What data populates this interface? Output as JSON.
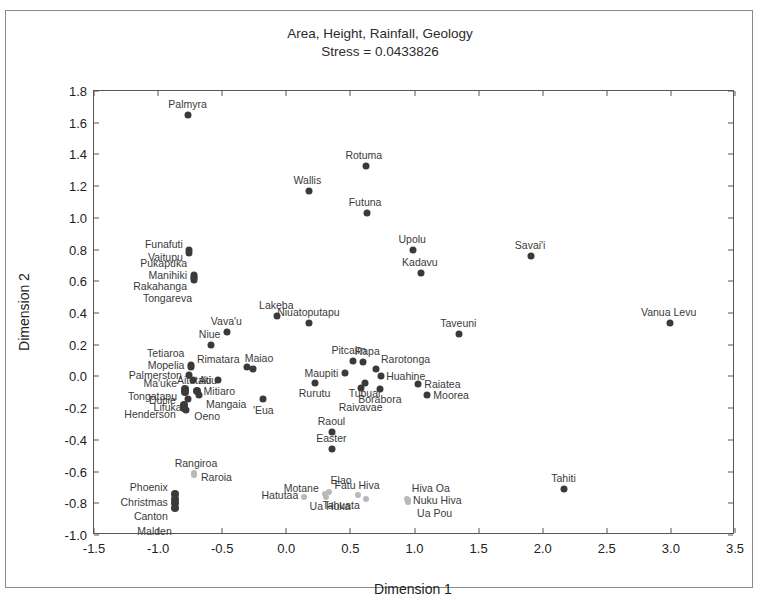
{
  "chart_data": {
    "type": "scatter",
    "title": "Area, Height, Rainfall, Geology",
    "subtitle": "Stress = 0.0433826",
    "xlabel": "Dimension 1",
    "ylabel": "Dimension 2",
    "xlim": [
      -1.5,
      3.5
    ],
    "ylim": [
      -1.0,
      1.8
    ],
    "xticks": [
      "-1.5",
      "-1.0",
      "-0.5",
      "0.0",
      "0.5",
      "1.0",
      "1.5",
      "2.0",
      "2.5",
      "3.0",
      "3.5"
    ],
    "xtick_values": [
      -1.5,
      -1.0,
      -0.5,
      0.0,
      0.5,
      1.0,
      1.5,
      2.0,
      2.5,
      3.0,
      3.5
    ],
    "yticks": [
      "1.8",
      "1.6",
      "1.4",
      "1.2",
      "1.0",
      "0.8",
      "0.6",
      "0.4",
      "0.2",
      "0.0",
      "-0.2",
      "-0.4",
      "-0.6",
      "-0.8",
      "-1.0"
    ],
    "ytick_values": [
      1.8,
      1.6,
      1.4,
      1.2,
      1.0,
      0.8,
      0.6,
      0.4,
      0.2,
      0.0,
      -0.2,
      -0.4,
      -0.6,
      -0.8,
      -1.0
    ],
    "grid": false,
    "legend": "none",
    "marker_colors": {
      "dark": "#3a3a3a",
      "mid": "#707070",
      "light": "#b9b9b9"
    },
    "points": [
      {
        "label": "Palmyra",
        "x": -0.77,
        "y": 1.65,
        "shade": "dark",
        "size": 7,
        "lpos": "c",
        "ldx": 0,
        "ldy": -11
      },
      {
        "label": "Rotuma",
        "x": 0.62,
        "y": 1.33,
        "shade": "dark",
        "size": 7,
        "lpos": "c",
        "ldx": -2,
        "ldy": -11
      },
      {
        "label": "Wallis",
        "x": 0.18,
        "y": 1.17,
        "shade": "dark",
        "size": 7,
        "lpos": "c",
        "ldx": -2,
        "ldy": -11
      },
      {
        "label": "Futuna",
        "x": 0.63,
        "y": 1.03,
        "shade": "dark",
        "size": 7,
        "lpos": "c",
        "ldx": -2,
        "ldy": -11
      },
      {
        "label": "Funafuti",
        "x": -0.76,
        "y": 0.8,
        "shade": "dark",
        "size": 7,
        "lpos": "r",
        "ldx": -6,
        "ldy": -6
      },
      {
        "label": "Vaitupu",
        "x": -0.76,
        "y": 0.78,
        "shade": "dark",
        "size": 7,
        "lpos": "r",
        "ldx": -6,
        "ldy": 4
      },
      {
        "label": "Upolu",
        "x": 0.99,
        "y": 0.8,
        "shade": "dark",
        "size": 7,
        "lpos": "c",
        "ldx": -1,
        "ldy": -11
      },
      {
        "label": "Savai'i",
        "x": 1.91,
        "y": 0.76,
        "shade": "dark",
        "size": 7,
        "lpos": "c",
        "ldx": -1,
        "ldy": -11
      },
      {
        "label": "Kadavu",
        "x": 1.05,
        "y": 0.65,
        "shade": "dark",
        "size": 7,
        "lpos": "c",
        "ldx": -1,
        "ldy": -11
      },
      {
        "label": "Pukapuka",
        "x": -0.72,
        "y": 0.64,
        "shade": "dark",
        "size": 7,
        "lpos": "r",
        "ldx": -7,
        "ldy": -12
      },
      {
        "label": "Manihiki",
        "x": -0.72,
        "y": 0.63,
        "shade": "dark",
        "size": 7,
        "lpos": "r",
        "ldx": -7,
        "ldy": -2
      },
      {
        "label": "Rakahanga",
        "x": -0.72,
        "y": 0.62,
        "shade": "dark",
        "size": 7,
        "lpos": "r",
        "ldx": -7,
        "ldy": 8
      },
      {
        "label": "Tongareva",
        "x": -0.72,
        "y": 0.61,
        "shade": "dark",
        "size": 7,
        "lpos": "r",
        "ldx": -2,
        "ldy": 18
      },
      {
        "label": "Lakeba",
        "x": -0.07,
        "y": 0.38,
        "shade": "dark",
        "size": 7,
        "lpos": "c",
        "ldx": -1,
        "ldy": -11
      },
      {
        "label": "Niuatoputapu",
        "x": 0.18,
        "y": 0.34,
        "shade": "dark",
        "size": 7,
        "lpos": "c",
        "ldx": -1,
        "ldy": -11
      },
      {
        "label": "Taveuni",
        "x": 1.35,
        "y": 0.27,
        "shade": "dark",
        "size": 7,
        "lpos": "c",
        "ldx": -1,
        "ldy": -11
      },
      {
        "label": "Vanua Levu",
        "x": 2.99,
        "y": 0.34,
        "shade": "dark",
        "size": 7,
        "lpos": "c",
        "ldx": -1,
        "ldy": -11
      },
      {
        "label": "Vava'u",
        "x": -0.46,
        "y": 0.28,
        "shade": "dark",
        "size": 7,
        "lpos": "c",
        "ldx": -1,
        "ldy": -11
      },
      {
        "label": "Niue",
        "x": -0.59,
        "y": 0.2,
        "shade": "dark",
        "size": 7,
        "lpos": "c",
        "ldx": -1,
        "ldy": -11
      },
      {
        "label": "Tetiaroa",
        "x": -0.74,
        "y": 0.07,
        "shade": "dark",
        "size": 7,
        "lpos": "r",
        "ldx": -7,
        "ldy": -12
      },
      {
        "label": "Mopelia",
        "x": -0.74,
        "y": 0.06,
        "shade": "dark",
        "size": 7,
        "lpos": "r",
        "ldx": -7,
        "ldy": -2
      },
      {
        "label": "Rimatara",
        "x": -0.31,
        "y": 0.06,
        "shade": "dark",
        "size": 7,
        "lpos": "r",
        "ldx": -7,
        "ldy": -8
      },
      {
        "label": "Maiao",
        "x": -0.26,
        "y": 0.05,
        "shade": "dark",
        "size": 7,
        "lpos": "c",
        "ldx": 6,
        "ldy": -11
      },
      {
        "label": "Pitcairn",
        "x": 0.52,
        "y": 0.1,
        "shade": "dark",
        "size": 7,
        "lpos": "c",
        "ldx": -4,
        "ldy": -11
      },
      {
        "label": "Rapa",
        "x": 0.6,
        "y": 0.09,
        "shade": "dark",
        "size": 7,
        "lpos": "c",
        "ldx": 4,
        "ldy": -11
      },
      {
        "label": "Palmerston",
        "x": -0.76,
        "y": 0.01,
        "shade": "dark",
        "size": 7,
        "lpos": "r",
        "ldx": -7,
        "ldy": 0
      },
      {
        "label": "Atiu",
        "x": -0.73,
        "y": -0.02,
        "shade": "dark",
        "size": 7,
        "lpos": "l",
        "ldx": 6,
        "ldy": 0
      },
      {
        "label": "Aitutaki",
        "x": -0.53,
        "y": -0.02,
        "shade": "dark",
        "size": 7,
        "lpos": "r",
        "ldx": -7,
        "ldy": 0
      },
      {
        "label": "Maupiti",
        "x": 0.46,
        "y": 0.02,
        "shade": "dark",
        "size": 7,
        "lpos": "r",
        "ldx": -7,
        "ldy": 0
      },
      {
        "label": "Rarotonga",
        "x": 0.7,
        "y": 0.05,
        "shade": "dark",
        "size": 7,
        "lpos": "l",
        "ldx": 5,
        "ldy": -10
      },
      {
        "label": "Huahine",
        "x": 0.74,
        "y": 0.0,
        "shade": "dark",
        "size": 7,
        "lpos": "l",
        "ldx": 5,
        "ldy": 0
      },
      {
        "label": "Raiatea",
        "x": 1.03,
        "y": -0.05,
        "shade": "dark",
        "size": 7,
        "lpos": "l",
        "ldx": 6,
        "ldy": 0
      },
      {
        "label": "Ma'uke",
        "x": -0.79,
        "y": -0.08,
        "shade": "dark",
        "size": 8,
        "lpos": "r",
        "ldx": -8,
        "ldy": -6
      },
      {
        "label": "Tongatapu",
        "x": -0.79,
        "y": -0.1,
        "shade": "dark",
        "size": 8,
        "lpos": "r",
        "ldx": -8,
        "ldy": 4
      },
      {
        "label": "Mitiaro",
        "x": -0.7,
        "y": -0.09,
        "shade": "dark",
        "size": 8,
        "lpos": "l",
        "ldx": 7,
        "ldy": 0
      },
      {
        "label": "Mangaia",
        "x": -0.68,
        "y": -0.12,
        "shade": "dark",
        "size": 7,
        "lpos": "l",
        "ldx": 7,
        "ldy": 9
      },
      {
        "label": "Lifuka",
        "x": -0.77,
        "y": -0.14,
        "shade": "dark",
        "size": 7,
        "lpos": "r",
        "ldx": -6,
        "ldy": 8
      },
      {
        "label": "Rurutu",
        "x": 0.22,
        "y": -0.04,
        "shade": "dark",
        "size": 7,
        "lpos": "c",
        "ldx": 0,
        "ldy": 10
      },
      {
        "label": "Tubuai",
        "x": 0.61,
        "y": -0.04,
        "shade": "dark",
        "size": 7,
        "lpos": "c",
        "ldx": 0,
        "ldy": 10
      },
      {
        "label": "Raivavae",
        "x": 0.58,
        "y": -0.07,
        "shade": "dark",
        "size": 7,
        "lpos": "c",
        "ldx": 0,
        "ldy": 19
      },
      {
        "label": "Borabora",
        "x": 0.73,
        "y": -0.08,
        "shade": "dark",
        "size": 7,
        "lpos": "c",
        "ldx": 0,
        "ldy": 10
      },
      {
        "label": "Moorea",
        "x": 1.1,
        "y": -0.12,
        "shade": "dark",
        "size": 7,
        "lpos": "l",
        "ldx": 6,
        "ldy": 0
      },
      {
        "label": "'Eua",
        "x": -0.18,
        "y": -0.14,
        "shade": "dark",
        "size": 7,
        "lpos": "c",
        "ldx": 0,
        "ldy": 11
      },
      {
        "label": "Ducie",
        "x": -0.8,
        "y": -0.18,
        "shade": "dark",
        "size": 8,
        "lpos": "r",
        "ldx": -8,
        "ldy": -5
      },
      {
        "label": "Henderson",
        "x": -0.8,
        "y": -0.2,
        "shade": "dark",
        "size": 8,
        "lpos": "r",
        "ldx": -8,
        "ldy": 6
      },
      {
        "label": "Oeno",
        "x": -0.78,
        "y": -0.21,
        "shade": "dark",
        "size": 7,
        "lpos": "l",
        "ldx": 8,
        "ldy": 6
      },
      {
        "label": "Raoul",
        "x": 0.36,
        "y": -0.35,
        "shade": "dark",
        "size": 7,
        "lpos": "c",
        "ldx": -1,
        "ldy": -11
      },
      {
        "label": "Easter",
        "x": 0.36,
        "y": -0.46,
        "shade": "dark",
        "size": 7,
        "lpos": "c",
        "ldx": -1,
        "ldy": -11
      },
      {
        "label": "Rangiroa",
        "x": -0.72,
        "y": -0.61,
        "shade": "light",
        "size": 6,
        "lpos": "c",
        "ldx": 2,
        "ldy": -10
      },
      {
        "label": "Raroia",
        "x": -0.72,
        "y": -0.62,
        "shade": "light",
        "size": 6,
        "lpos": "l",
        "ldx": 7,
        "ldy": 2
      },
      {
        "label": "Tahiti",
        "x": 2.17,
        "y": -0.71,
        "shade": "dark",
        "size": 7,
        "lpos": "c",
        "ldx": -1,
        "ldy": -11
      },
      {
        "label": "Motane",
        "x": 0.3,
        "y": -0.74,
        "shade": "light",
        "size": 6,
        "lpos": "r",
        "ldx": -6,
        "ldy": -6
      },
      {
        "label": "Elao",
        "x": 0.33,
        "y": -0.73,
        "shade": "light",
        "size": 6,
        "lpos": "l",
        "ldx": 2,
        "ldy": -12
      },
      {
        "label": "Hatutaa",
        "x": 0.14,
        "y": -0.76,
        "shade": "light",
        "size": 6,
        "lpos": "r",
        "ldx": -6,
        "ldy": -2
      },
      {
        "label": "Ua Huka",
        "x": 0.31,
        "y": -0.76,
        "shade": "light",
        "size": 6,
        "lpos": "c",
        "ldx": 4,
        "ldy": 9
      },
      {
        "label": "Fatu Hiva",
        "x": 0.56,
        "y": -0.75,
        "shade": "light",
        "size": 6,
        "lpos": "c",
        "ldx": -1,
        "ldy": -10
      },
      {
        "label": "Tahuata",
        "x": 0.62,
        "y": -0.77,
        "shade": "light",
        "size": 6,
        "lpos": "r",
        "ldx": -6,
        "ldy": 6
      },
      {
        "label": "Hiva Oa",
        "x": 0.94,
        "y": -0.77,
        "shade": "light",
        "size": 6,
        "lpos": "l",
        "ldx": 5,
        "ldy": -11
      },
      {
        "label": "Nuku Hiva",
        "x": 0.95,
        "y": -0.78,
        "shade": "light",
        "size": 6,
        "lpos": "l",
        "ldx": 5,
        "ldy": 0
      },
      {
        "label": "Ua Pou",
        "x": 0.95,
        "y": -0.79,
        "shade": "light",
        "size": 6,
        "lpos": "l",
        "ldx": 9,
        "ldy": 11
      },
      {
        "label": "Phoenix",
        "x": -0.87,
        "y": -0.74,
        "shade": "dark",
        "size": 8,
        "lpos": "r",
        "ldx": -7,
        "ldy": -7
      },
      {
        "label": "Christmas",
        "x": -0.87,
        "y": -0.77,
        "shade": "dark",
        "size": 8,
        "lpos": "r",
        "ldx": -7,
        "ldy": 3
      },
      {
        "label": "Canton",
        "x": -0.87,
        "y": -0.8,
        "shade": "dark",
        "size": 8,
        "lpos": "r",
        "ldx": -7,
        "ldy": 13
      },
      {
        "label": "Malden",
        "x": -0.87,
        "y": -0.83,
        "shade": "dark",
        "size": 8,
        "lpos": "r",
        "ldx": -3,
        "ldy": 23
      }
    ]
  }
}
